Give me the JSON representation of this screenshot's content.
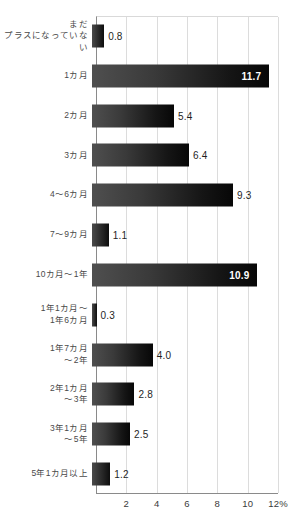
{
  "chart_data": {
    "type": "bar",
    "orientation": "horizontal",
    "title": "",
    "subtitle": "",
    "xlabel": "",
    "ylabel": "",
    "xlim": [
      0,
      12
    ],
    "unit": "%",
    "grid": true,
    "legend": false,
    "gridline_values": [
      2,
      4,
      6,
      8,
      10,
      12
    ],
    "tick_labels": [
      "2",
      "4",
      "6",
      "8",
      "10",
      "12%"
    ],
    "categories": [
      "まだ\nプラスになっていない",
      "1カ月",
      "2カ月",
      "3カ月",
      "4〜6カ月",
      "7〜9カ月",
      "10カ月〜1年",
      "1年1カ月〜\n1年6カ月",
      "1年7カ月\n〜2年",
      "2年1カ月\n〜3年",
      "3年1カ月\n〜5年",
      "5年1カ月以上"
    ],
    "values": [
      0.8,
      11.7,
      5.4,
      6.4,
      9.3,
      1.1,
      10.9,
      0.3,
      4.0,
      2.8,
      2.5,
      1.2
    ],
    "value_labels": [
      "0.8",
      "11.7",
      "5.4",
      "6.4",
      "9.3",
      "1.1",
      "10.9",
      "0.3",
      "4.0",
      "2.8",
      "2.5",
      "1.2"
    ],
    "label_placement": [
      "outside",
      "inside",
      "outside",
      "outside",
      "outside",
      "outside",
      "inside",
      "outside",
      "outside",
      "outside",
      "outside",
      "outside"
    ],
    "colors": {
      "bar_start": "#4f4f4f",
      "bar_end": "#070707",
      "gridline": "#dcdcdc",
      "axis": "#8a8a8a",
      "label_text": "#4a4a4a",
      "value_text": "#1f1f1f",
      "value_text_inside": "#ffffff",
      "background": "#ffffff"
    }
  }
}
